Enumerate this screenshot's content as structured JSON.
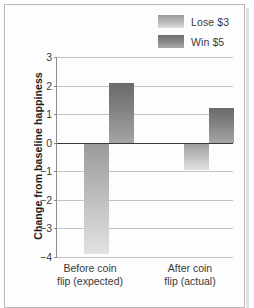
{
  "chart_data": {
    "type": "bar",
    "title": "",
    "xlabel": "",
    "ylabel": "Change from baseline happiness",
    "categories": [
      "Before coin\nflip (expected)",
      "After coin\nflip (actual)"
    ],
    "series": [
      {
        "name": "Lose $3",
        "values": [
          -3.9,
          -0.95
        ],
        "color": "#bdbdbd"
      },
      {
        "name": "Win $5",
        "values": [
          2.1,
          1.2
        ],
        "color": "#7f7f7f"
      }
    ],
    "ylim": [
      -4,
      3
    ],
    "yticks": [
      "3",
      "2",
      "1",
      "0",
      "−1",
      "−2",
      "−3",
      "−4"
    ],
    "ytick_values": [
      3,
      2,
      1,
      0,
      -1,
      -2,
      -3,
      -4
    ],
    "grid": true,
    "legend_position": "top-right",
    "zero_line": 0
  },
  "legend": {
    "items": [
      {
        "label": "Lose $3",
        "swatch": "lose-swatch"
      },
      {
        "label": "Win $5",
        "swatch": "win-swatch"
      }
    ]
  },
  "axis": {
    "y_title": "Change from baseline happiness",
    "ticks": [
      "3",
      "2",
      "1",
      "0",
      "−1",
      "−2",
      "−3",
      "−4"
    ]
  },
  "xaxis": {
    "labels": [
      "Before coin\nflip (expected)",
      "After coin\nflip (actual)"
    ]
  }
}
